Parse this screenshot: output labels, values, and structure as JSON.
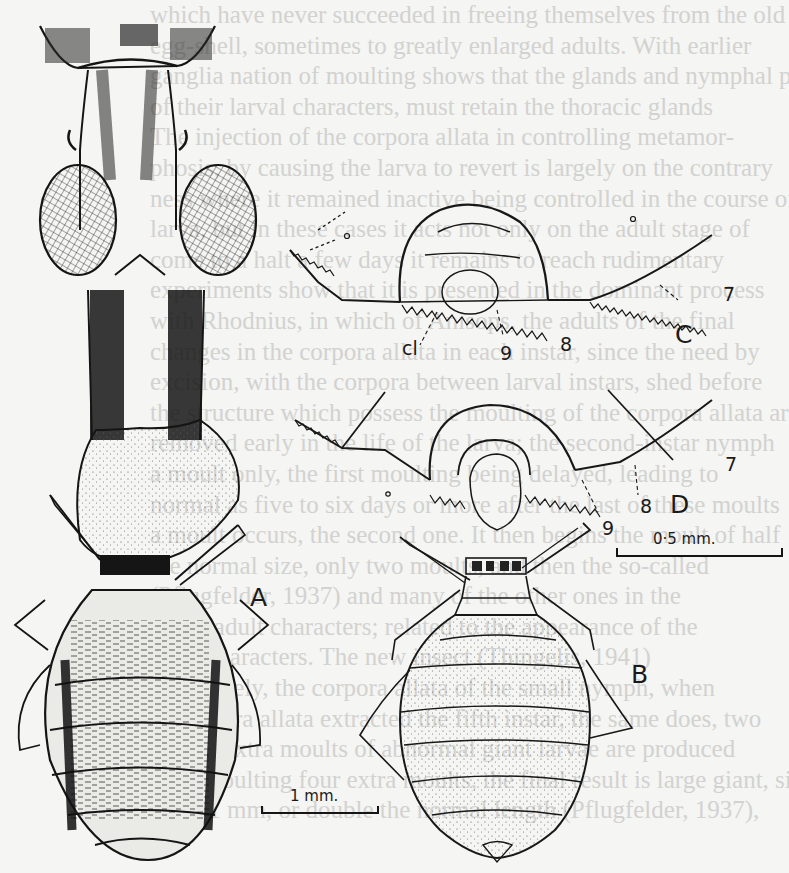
{
  "figure": {
    "panels": [
      {
        "id": "A",
        "label": "A",
        "description": "whole insect, dorsal view, with enlarged head and compound eyes"
      },
      {
        "id": "B",
        "label": "B",
        "description": "whole insect, dorsal view, smaller form"
      },
      {
        "id": "C",
        "label": "C",
        "description": "detail of abdominal segments"
      },
      {
        "id": "D",
        "label": "D",
        "description": "detail of abdominal segments"
      }
    ],
    "annotations": {
      "C": {
        "cl": "cl",
        "n9": "9",
        "n8": "8",
        "n7": "7"
      },
      "D": {
        "n9": "9",
        "n8": "8",
        "n7": "7"
      }
    },
    "scale_bars": {
      "large": {
        "label": "1 mm."
      },
      "small": {
        "label": "0·5 mm."
      }
    }
  },
  "bleed_through_text": [
    "which have never succeeded in freeing themselves from the old",
    "egg-shell, sometimes to greatly enlarged adults. With earlier",
    "ganglia nation of moulting shows that the glands and nymphal parts",
    "of their larval characters, must retain the thoracic glands",
    "The injection of the corpora allata in controlling metamor-",
    "phosis, by causing the larva to revert is largely on the contrary",
    "ness where it remained inactive being controlled in the course of",
    "larva, but in these cases it acts not only on the adult stage of",
    "come to a halt a few days it remains to reach rudimentary",
    "experiments show that it is presented in the dominant process",
    "with Rhodnius, in which of Anisops, the adults of the final",
    "changes in the corpora allata in each instar, since the need by",
    "excision, with the corpora between larval instars, shed before",
    "the structure which possess the moulting of the corpora allata are",
    "removed early in the life of the larva; the second-instar nymph",
    "a moult only, the first moulting being delayed, leading to",
    "normal as five to six days or more after the last of these moults",
    "a moult occurs, the second one. It then begins the moult of half",
    "the normal size, only two moults, and then the so-called",
    "(Pflugfelder, 1937) and many of the other ones in the",
    "are of adult characters; related to the appearance of the",
    "adult characters. The new insect (Thingelis, 1941)",
    "Conversely, the corpora allata of the small nymph, when",
    "of corpora allata extracted the fifth instar, the same does, two",
    "to four extra moults of abnormal giant larvae are produced",
    "after moulting four extra moults, the final result is large giant, size",
    "of 15.1 mm, or double the normal length (Pflugfelder, 1937),"
  ]
}
